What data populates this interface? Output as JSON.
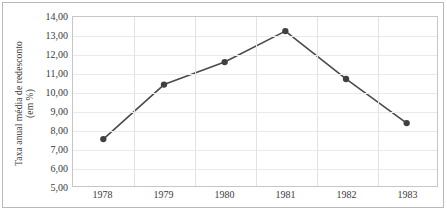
{
  "chart_data": {
    "type": "line",
    "title": "",
    "xlabel": "",
    "ylabel": "Taxa anual média de redesconto (em %)",
    "ylabel_lines": [
      "Taxa anual média de redesconto",
      "(em %)"
    ],
    "categories": [
      "1978",
      "1979",
      "1980",
      "1981",
      "1982",
      "1983"
    ],
    "values": [
      7.5,
      10.4,
      11.6,
      13.25,
      10.7,
      8.35
    ],
    "series": [
      {
        "name": "Taxa anual média de redesconto",
        "values": [
          7.5,
          10.4,
          11.6,
          13.25,
          10.7,
          8.35
        ]
      }
    ],
    "ylim": [
      5.0,
      14.0
    ],
    "ytick_values": [
      5.0,
      6.0,
      7.0,
      8.0,
      9.0,
      10.0,
      11.0,
      12.0,
      13.0,
      14.0
    ],
    "ytick_labels": [
      "5,00",
      "6,00",
      "7,00",
      "8,00",
      "9,00",
      "10,00",
      "11,00",
      "12,00",
      "13,00",
      "14,00"
    ],
    "grid": {
      "horizontal": true,
      "vertical": true
    },
    "legend": {
      "visible": false,
      "position": "none"
    },
    "colors": {
      "line": "#4a4a4a",
      "marker": "#404040",
      "gridline_horizontal": "#e9e9e9",
      "gridline_vertical": "#e2e2e2",
      "plot_border": "#c6c6c6",
      "outer_border": "#b9b9b9",
      "text": "#3a3a3a",
      "background": "#ffffff"
    },
    "marker": {
      "shape": "circle",
      "radius": 3.2
    },
    "line_width": 1.6
  }
}
